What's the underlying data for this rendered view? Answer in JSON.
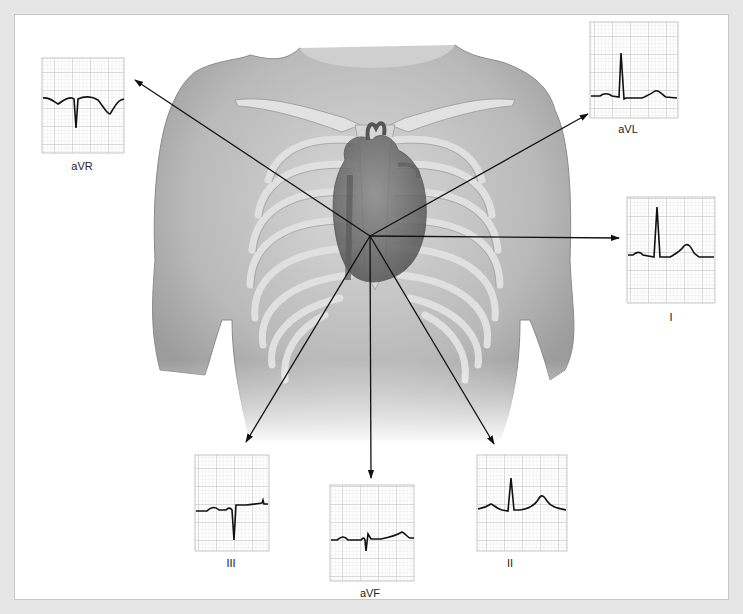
{
  "diagram": {
    "center": [
      370,
      236
    ],
    "leads": [
      {
        "id": "aVR",
        "label": "aVR",
        "label_pos": [
          82,
          160
        ],
        "arrow_tip": [
          135,
          80
        ]
      },
      {
        "id": "aVL",
        "label": "aVL",
        "label_pos": [
          628,
          123
        ],
        "arrow_tip": [
          588,
          114
        ]
      },
      {
        "id": "I",
        "label": "I",
        "label_pos": [
          671,
          311
        ],
        "arrow_tip": [
          619,
          238
        ]
      },
      {
        "id": "III",
        "label": "III",
        "label_pos": [
          231,
          557
        ],
        "arrow_tip": [
          246,
          442
        ]
      },
      {
        "id": "aVF",
        "label": "aVF",
        "label_pos": [
          370,
          587
        ],
        "arrow_tip": [
          371,
          478
        ]
      },
      {
        "id": "II",
        "label": "II",
        "label_pos": [
          510,
          557
        ],
        "arrow_tip": [
          494,
          444
        ]
      }
    ],
    "colors": {
      "grid_major": "#b8b8b8",
      "grid_minor": "#dcdcdc",
      "trace": "#111111",
      "background": "#ffffff",
      "frame": "#e6e6e6",
      "body": "#b5b5b5"
    }
  }
}
